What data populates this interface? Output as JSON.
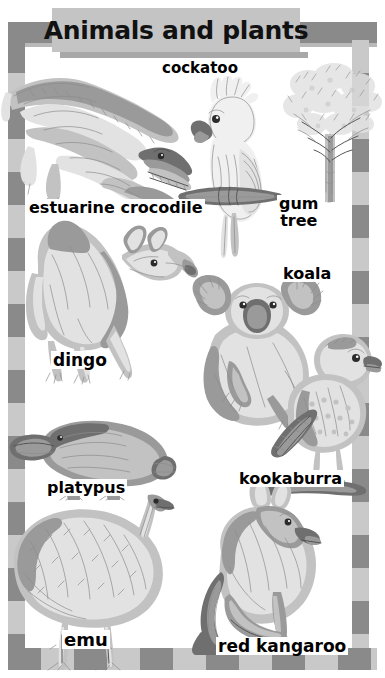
{
  "page": {
    "title": "Animals and plants",
    "background_color": "#ffffff",
    "frame_dark_color": "#8a8a8a",
    "frame_light_color": "#c9c9c9",
    "title_box_color": "#c4c4c4",
    "label_text_color": "#000000"
  },
  "labels": [
    {
      "id": "cockatoo",
      "text": "cockatoo",
      "icon": "cockatoo-illustration"
    },
    {
      "id": "estuarine-crocodile",
      "text": "estuarine crocodile",
      "icon": "crocodile-illustration"
    },
    {
      "id": "gum-tree",
      "text": "gum\ntree",
      "icon": "gum-tree-illustration"
    },
    {
      "id": "koala",
      "text": "koala",
      "icon": "koala-illustration"
    },
    {
      "id": "dingo",
      "text": "dingo",
      "icon": "dingo-illustration"
    },
    {
      "id": "platypus",
      "text": "platypus",
      "icon": "platypus-illustration"
    },
    {
      "id": "kookaburra",
      "text": "kookaburra",
      "icon": "kookaburra-illustration"
    },
    {
      "id": "emu",
      "text": "emu",
      "icon": "emu-illustration"
    },
    {
      "id": "red-kangaroo",
      "text": "red kangaroo",
      "icon": "kangaroo-illustration"
    }
  ]
}
